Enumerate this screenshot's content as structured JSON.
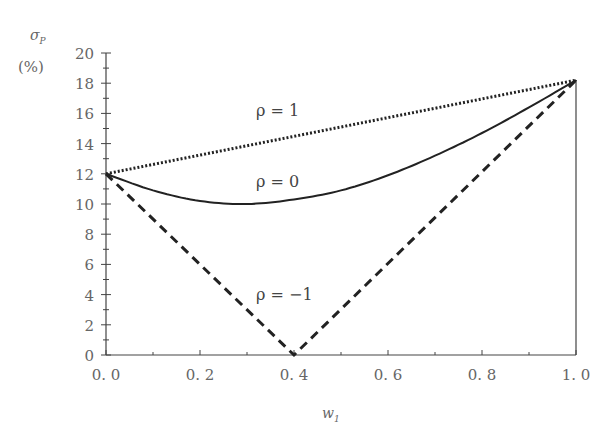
{
  "chart_data": {
    "type": "line",
    "title": "",
    "xlabel": "w1",
    "ylabel": "σP (%)",
    "xlim": [
      0.0,
      1.0
    ],
    "ylim": [
      0,
      20
    ],
    "grid": false,
    "legend": "none (inline labels)",
    "x_ticks": [
      "0.0",
      "0.2",
      "0.4",
      "0.6",
      "0.8",
      "1.0"
    ],
    "y_ticks": [
      "0",
      "2",
      "4",
      "6",
      "8",
      "10",
      "12",
      "14",
      "16",
      "18",
      "20"
    ],
    "series": [
      {
        "name": "ρ = 1",
        "style": "dotted",
        "x": [
          0.0,
          1.0
        ],
        "values": [
          12.0,
          18.2
        ]
      },
      {
        "name": "ρ = 0",
        "style": "solid",
        "x": [
          0.0,
          0.1,
          0.2,
          0.3,
          0.4,
          0.5,
          0.6,
          0.7,
          0.8,
          0.9,
          1.0
        ],
        "values": [
          12.0,
          10.9,
          10.2,
          10.0,
          10.3,
          10.9,
          11.9,
          13.2,
          14.7,
          16.4,
          18.2
        ]
      },
      {
        "name": "ρ = −1",
        "style": "dashed",
        "x": [
          0.0,
          0.4,
          1.0
        ],
        "values": [
          12.0,
          0.0,
          18.2
        ]
      }
    ],
    "annotations": [
      {
        "text": "ρ = 1",
        "x": 0.35,
        "y": 15.5
      },
      {
        "text": "ρ = 0",
        "x": 0.35,
        "y": 11.3
      },
      {
        "text": "ρ = −1",
        "x": 0.35,
        "y": 4.0
      }
    ]
  },
  "labels": {
    "y_title_line1": "σ",
    "y_title_sub": "P",
    "y_title_line2": "(%)",
    "x_title": "w",
    "x_title_sub": "1",
    "rho1": "ρ = 1",
    "rho0": "ρ = 0",
    "rhoNeg1": "ρ = −1"
  }
}
